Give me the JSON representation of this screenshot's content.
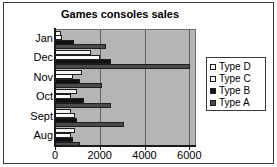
{
  "chart_data": {
    "type": "bar",
    "orientation": "horizontal",
    "title": "Games consoles sales",
    "xlabel": "",
    "ylabel": "",
    "categories": [
      "Aug",
      "Sept",
      "Oct",
      "Nov",
      "Dec",
      "Jan"
    ],
    "series": [
      {
        "name": "Type A",
        "color": "#4a4a4a",
        "values": [
          1100,
          3100,
          2500,
          2100,
          6050,
          2300
        ]
      },
      {
        "name": "Type B",
        "color": "#111111",
        "values": [
          800,
          1000,
          1300,
          1100,
          2500,
          830
        ]
      },
      {
        "name": "Type C",
        "color": "#fafafa",
        "values": [
          700,
          900,
          700,
          800,
          2000,
          330
        ]
      },
      {
        "name": "Type D",
        "color": "#f2f2f2",
        "values": [
          900,
          700,
          1000,
          1200,
          1600,
          280
        ]
      }
    ],
    "xlim": [
      0,
      6300
    ],
    "xticks": [
      0,
      2000,
      4000,
      6000
    ],
    "xtick_labels": [
      "0",
      "2000",
      "4000",
      "6000"
    ],
    "grid": "vertical",
    "legend_position": "right",
    "legend_entries": [
      "Type D",
      "Type C",
      "Type B",
      "Type A"
    ],
    "plot_background": "#b5b5b5"
  }
}
